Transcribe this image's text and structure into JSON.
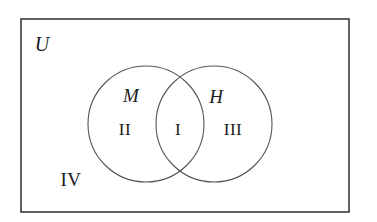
{
  "figure": {
    "type": "venn-diagram",
    "background_color": "#ffffff",
    "stroke_color": "#3a3a3a",
    "text_color": "#1b1b1b"
  },
  "universe": {
    "label": "U",
    "rect": {
      "x": 21,
      "y": 19,
      "width": 328,
      "height": 193
    },
    "label_position": {
      "x": 42,
      "y": 44
    }
  },
  "sets": [
    {
      "id": "set-m",
      "label": "M",
      "circle": {
        "cx": 146,
        "cy": 124,
        "r": 58
      },
      "label_position": {
        "x": 131,
        "y": 95
      }
    },
    {
      "id": "set-h",
      "label": "H",
      "circle": {
        "cx": 214,
        "cy": 124,
        "r": 58
      },
      "label_position": {
        "x": 216,
        "y": 96
      }
    }
  ],
  "regions": [
    {
      "id": "region-i",
      "label": "I",
      "meaning": "M and H",
      "position": {
        "x": 178,
        "y": 129
      }
    },
    {
      "id": "region-ii",
      "label": "II",
      "meaning": "M only",
      "position": {
        "x": 125,
        "y": 129
      }
    },
    {
      "id": "region-iii",
      "label": "III",
      "meaning": "H only",
      "position": {
        "x": 233,
        "y": 129
      }
    },
    {
      "id": "region-iv",
      "label": "IV",
      "meaning": "outside both sets",
      "position": {
        "x": 71,
        "y": 179
      }
    }
  ]
}
